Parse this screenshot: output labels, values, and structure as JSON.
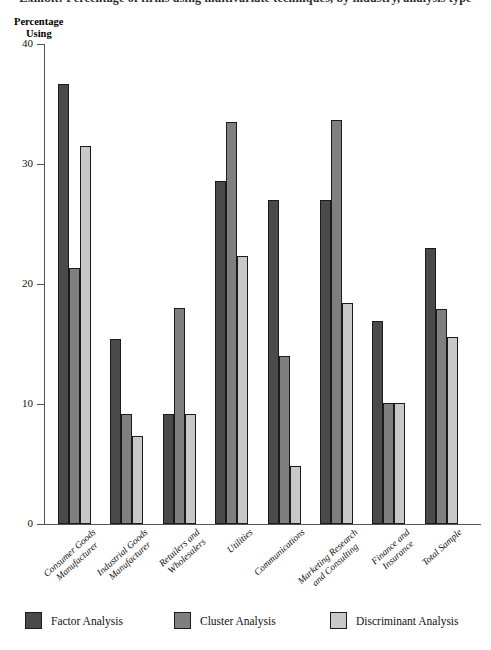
{
  "title_fragment": "Exhibit: Percentage of firms using multivariate techniques, by industry, analysis type",
  "axis_title": {
    "line1": "Percentage",
    "line2": "Using"
  },
  "chart_data": {
    "type": "bar",
    "title": "",
    "xlabel": "",
    "ylabel": "Percentage Using",
    "ylim": [
      0,
      40
    ],
    "yticks": [
      0,
      10,
      20,
      30,
      40
    ],
    "grid": false,
    "legend_position": "bottom",
    "categories": [
      "Consumer Goods Manufacturer",
      "Industrial Goods Manufacturer",
      "Retailers and Wholesalers",
      "Utilities",
      "Communications",
      "Marketing Research and Consulting",
      "Finance and Insurance",
      "Total Sample"
    ],
    "category_lines": [
      [
        "Consumer Goods",
        "Manufacturer"
      ],
      [
        "Industrial Goods",
        "Manufacturer"
      ],
      [
        "Retailers and",
        "Wholesalers"
      ],
      [
        "Utilities"
      ],
      [
        "Communications"
      ],
      [
        "Marketing Research",
        "and Consulting"
      ],
      [
        "Finance and",
        "Insurance"
      ],
      [
        "Total Sample"
      ]
    ],
    "series": [
      {
        "name": "Factor Analysis",
        "color": "#4a4a4a",
        "values": [
          36.7,
          15.4,
          9.2,
          28.6,
          27.0,
          27.0,
          16.9,
          23.0
        ]
      },
      {
        "name": "Cluster Analysis",
        "color": "#7f7f7f",
        "values": [
          21.3,
          9.2,
          18.0,
          33.5,
          14.0,
          33.7,
          10.1,
          17.9
        ]
      },
      {
        "name": "Discriminant Analysis",
        "color": "#c8c8c8",
        "values": [
          31.5,
          7.3,
          9.2,
          22.3,
          4.8,
          18.4,
          10.1,
          15.6
        ]
      }
    ]
  }
}
